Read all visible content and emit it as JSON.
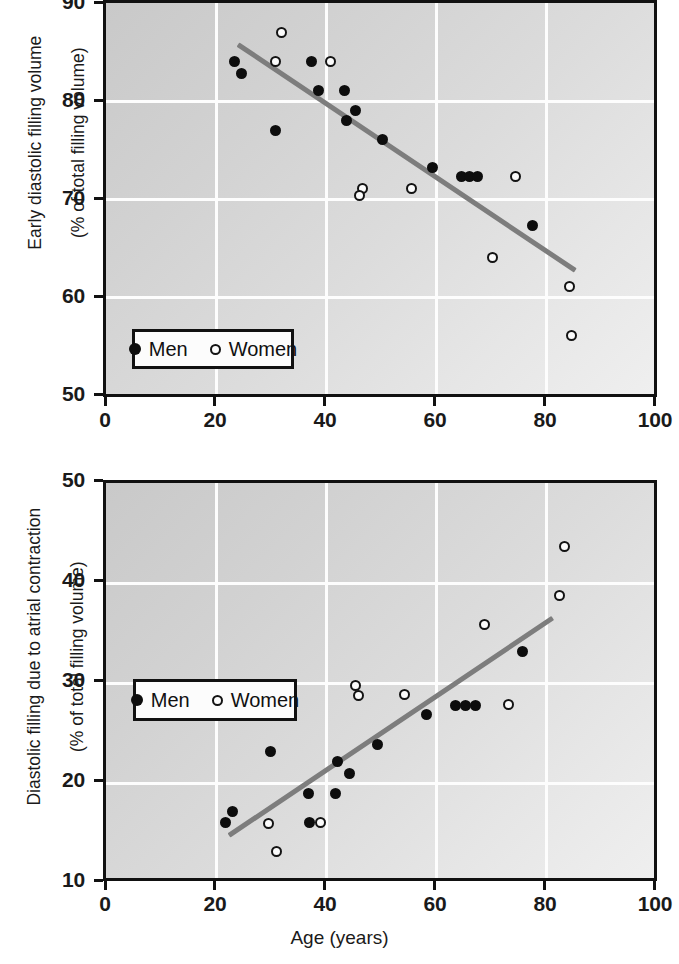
{
  "figure": {
    "xlabel": "Age (years)",
    "legend": {
      "men_label": "Men",
      "women_label": "Women"
    },
    "colors": {
      "marker_men": "#0d0d0d",
      "marker_women": "#fbfbfb",
      "marker_women_edge": "#131313",
      "trendline": "#7d7d7d",
      "axis": "#111111",
      "gridline": "#fdfdfd",
      "plot_background": "#d8d8d8"
    }
  },
  "chart_data": [
    {
      "type": "scatter",
      "title": "",
      "xlabel": "",
      "ylabel": "Early diastolic filling volume\n(% of total filling volume)",
      "ylabel_line1": "Early diastolic filling volume",
      "ylabel_line2": "(% of total filling volume)",
      "xlim": [
        0,
        100
      ],
      "ylim": [
        50,
        90
      ],
      "xticks": [
        0,
        20,
        40,
        60,
        80,
        100
      ],
      "yticks": [
        50,
        60,
        70,
        80,
        90
      ],
      "xticklabels": [
        "0",
        "20",
        "40",
        "60",
        "80",
        "100"
      ],
      "yticklabels": [
        "50",
        "60",
        "70",
        "80",
        "90"
      ],
      "grid": true,
      "legend_position": "lower left",
      "series": [
        {
          "name": "Men",
          "marker": "filled-circle",
          "points": [
            [
              23.5,
              84.0
            ],
            [
              24.8,
              82.8
            ],
            [
              31.0,
              77.0
            ],
            [
              37.5,
              84.0
            ],
            [
              38.8,
              81.0
            ],
            [
              43.5,
              81.0
            ],
            [
              43.8,
              78.0
            ],
            [
              45.5,
              79.0
            ],
            [
              50.5,
              76.0
            ],
            [
              59.5,
              73.2
            ],
            [
              64.8,
              72.2
            ],
            [
              66.3,
              72.2
            ],
            [
              67.8,
              72.2
            ],
            [
              77.8,
              67.2
            ]
          ]
        },
        {
          "name": "Women",
          "marker": "open-circle",
          "points": [
            [
              32.0,
              87.0
            ],
            [
              31.0,
              84.0
            ],
            [
              41.0,
              84.0
            ],
            [
              46.8,
              71.0
            ],
            [
              46.2,
              70.3
            ],
            [
              55.8,
              71.0
            ],
            [
              74.8,
              72.2
            ],
            [
              70.5,
              64.0
            ],
            [
              84.5,
              61.0
            ],
            [
              85.0,
              56.0
            ]
          ]
        }
      ],
      "trendline": {
        "x_start": 24.0,
        "y_start": 85.8,
        "x_end": 85.5,
        "y_end": 62.7
      }
    },
    {
      "type": "scatter",
      "title": "",
      "xlabel": "Age (years)",
      "ylabel": "Diastolic filling due to atrial contraction\n(% of total filling volume)",
      "ylabel_line1": "Diastolic filling due to atrial contraction",
      "ylabel_line2": "(% of total filling volume)",
      "xlim": [
        0,
        100
      ],
      "ylim": [
        10,
        50
      ],
      "xticks": [
        0,
        20,
        40,
        60,
        80,
        100
      ],
      "yticks": [
        10,
        20,
        30,
        40,
        50
      ],
      "xticklabels": [
        "0",
        "20",
        "40",
        "60",
        "80",
        "100"
      ],
      "yticklabels": [
        "10",
        "20",
        "30",
        "40",
        "50"
      ],
      "grid": true,
      "legend_position": "center left",
      "series": [
        {
          "name": "Men",
          "marker": "filled-circle",
          "points": [
            [
              21.8,
              15.6
            ],
            [
              23.0,
              16.7
            ],
            [
              30.0,
              22.8
            ],
            [
              37.2,
              15.6
            ],
            [
              37.0,
              18.6
            ],
            [
              41.8,
              18.6
            ],
            [
              42.2,
              21.8
            ],
            [
              44.5,
              20.6
            ],
            [
              49.5,
              23.5
            ],
            [
              58.5,
              26.6
            ],
            [
              63.8,
              27.5
            ],
            [
              65.6,
              27.5
            ],
            [
              67.4,
              27.5
            ],
            [
              76.0,
              32.9
            ]
          ]
        },
        {
          "name": "Women",
          "marker": "open-circle",
          "points": [
            [
              29.6,
              15.5
            ],
            [
              31.2,
              12.7
            ],
            [
              39.2,
              15.6
            ],
            [
              45.5,
              29.5
            ],
            [
              46.0,
              28.5
            ],
            [
              54.5,
              28.6
            ],
            [
              69.0,
              35.7
            ],
            [
              73.4,
              27.6
            ],
            [
              82.8,
              38.6
            ],
            [
              83.6,
              43.6
            ]
          ]
        }
      ],
      "trendline": {
        "x_start": 22.5,
        "y_start": 14.3,
        "x_end": 81.5,
        "y_end": 36.3
      }
    }
  ]
}
